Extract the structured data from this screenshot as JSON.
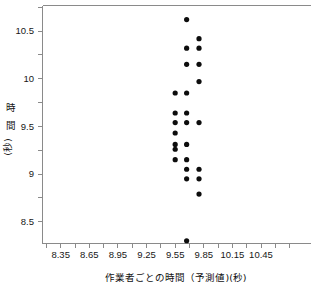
{
  "chart_data": {
    "type": "scatter",
    "title": "",
    "xlabel": "作業者ごとの時間（予測値)(秒)",
    "ylabel": "時 間 (秒)",
    "xlim": [
      8.23,
      10.6
    ],
    "ylim": [
      8.22,
      10.72
    ],
    "grid": false,
    "legend": null,
    "xticks": [
      "8.35",
      "8.65",
      "8.95",
      "9.25",
      "9.55",
      "9.85",
      "10.15",
      "10.45"
    ],
    "xtick_values": [
      8.35,
      8.65,
      8.95,
      9.25,
      9.55,
      9.85,
      10.15,
      10.45
    ],
    "xminor_step": 0.15,
    "yticks": [
      "10.5",
      "10",
      "9.5",
      "9",
      "8.5"
    ],
    "ytick_values": [
      10.5,
      10.0,
      9.5,
      9.0,
      8.5
    ],
    "yminor_step": 0.25,
    "marker": "filled-circle",
    "marker_color": "#0d0d0d",
    "marker_size": 3.4,
    "points": [
      {
        "x": 9.67,
        "y": 10.62
      },
      {
        "x": 9.8,
        "y": 10.42
      },
      {
        "x": 9.67,
        "y": 10.32
      },
      {
        "x": 9.8,
        "y": 10.32
      },
      {
        "x": 9.67,
        "y": 10.15
      },
      {
        "x": 9.8,
        "y": 10.15
      },
      {
        "x": 9.8,
        "y": 9.97
      },
      {
        "x": 9.55,
        "y": 9.85
      },
      {
        "x": 9.67,
        "y": 9.85
      },
      {
        "x": 9.55,
        "y": 9.64
      },
      {
        "x": 9.67,
        "y": 9.64
      },
      {
        "x": 9.55,
        "y": 9.54
      },
      {
        "x": 9.67,
        "y": 9.54
      },
      {
        "x": 9.8,
        "y": 9.54
      },
      {
        "x": 9.55,
        "y": 9.43
      },
      {
        "x": 9.55,
        "y": 9.31
      },
      {
        "x": 9.67,
        "y": 9.31
      },
      {
        "x": 9.55,
        "y": 9.26
      },
      {
        "x": 9.55,
        "y": 9.15
      },
      {
        "x": 9.67,
        "y": 9.15
      },
      {
        "x": 9.67,
        "y": 9.05
      },
      {
        "x": 9.8,
        "y": 9.05
      },
      {
        "x": 9.67,
        "y": 8.95
      },
      {
        "x": 9.8,
        "y": 8.95
      },
      {
        "x": 9.8,
        "y": 8.79
      },
      {
        "x": 9.67,
        "y": 8.3
      }
    ]
  },
  "axes": {
    "x_title": "作業者ごとの時間（予測値)(秒)",
    "y_title_chars": [
      "時",
      "間",
      "(秒)"
    ]
  }
}
